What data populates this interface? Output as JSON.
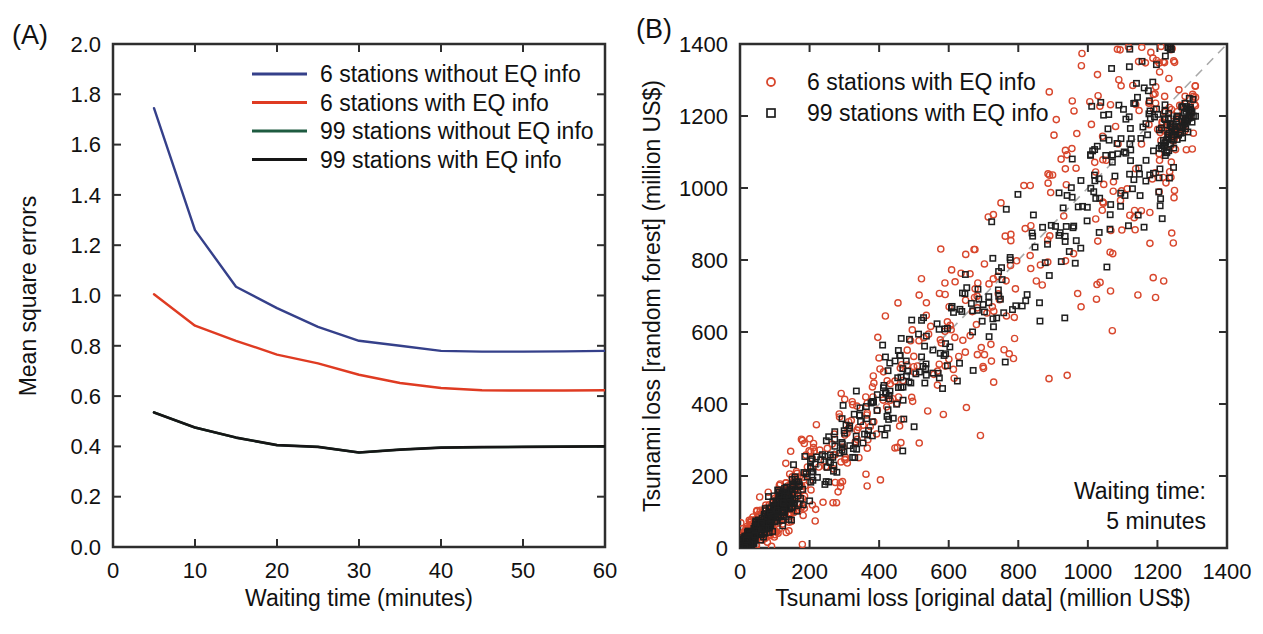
{
  "figure": {
    "background": "#ffffff",
    "panels": [
      {
        "tag": "(A)"
      },
      {
        "tag": "(B)"
      }
    ]
  },
  "style": {
    "frame_color": "#2e2e2e",
    "text_color": "#111111",
    "diagonal_color": "#a9a9a9"
  },
  "chart_data": [
    {
      "type": "line",
      "title": "",
      "xlabel": "Waiting time (minutes)",
      "ylabel": "Mean square errors",
      "xlim": [
        0,
        60
      ],
      "ylim": [
        0.0,
        2.0
      ],
      "x_ticks": [
        0,
        10,
        20,
        30,
        40,
        50,
        60
      ],
      "y_ticks": [
        0.0,
        0.2,
        0.4,
        0.6,
        0.8,
        1.0,
        1.2,
        1.4,
        1.6,
        1.8,
        2.0
      ],
      "y_tick_decimals": 1,
      "grid": false,
      "legend_position": "top-center-inside",
      "x": [
        5,
        10,
        15,
        20,
        25,
        30,
        35,
        40,
        45,
        50,
        55,
        60
      ],
      "series": [
        {
          "name": "6 stations without EQ info",
          "color": "#35408a",
          "values": [
            1.745,
            1.26,
            1.035,
            0.95,
            0.875,
            0.82,
            0.8,
            0.78,
            0.777,
            0.777,
            0.778,
            0.78
          ]
        },
        {
          "name": "6 stations with EQ info",
          "color": "#df3b22",
          "values": [
            1.005,
            0.88,
            0.82,
            0.765,
            0.73,
            0.685,
            0.652,
            0.632,
            0.623,
            0.622,
            0.622,
            0.623
          ]
        },
        {
          "name": "99 stations without EQ info",
          "color": "#1e5b40",
          "values": [
            0.535,
            0.475,
            0.435,
            0.405,
            0.398,
            0.376,
            0.387,
            0.395,
            0.397,
            0.398,
            0.399,
            0.4
          ]
        },
        {
          "name": "99 stations with EQ info",
          "color": "#161616",
          "values": [
            0.535,
            0.475,
            0.435,
            0.405,
            0.398,
            0.376,
            0.387,
            0.395,
            0.397,
            0.398,
            0.399,
            0.4
          ]
        }
      ],
      "note": "99-stations-without-EQ-info curve is hidden beneath the 99-stations-with-EQ-info curve"
    },
    {
      "type": "scatter",
      "title": "",
      "xlabel": "Tsunami loss [original data] (million US$)",
      "ylabel": "Tsunami loss [random forest] (million US$)",
      "xlim": [
        0,
        1400
      ],
      "ylim": [
        0,
        1400
      ],
      "x_ticks": [
        0,
        200,
        400,
        600,
        800,
        1000,
        1200,
        1400
      ],
      "y_ticks": [
        0,
        200,
        400,
        600,
        800,
        1000,
        1200,
        1400
      ],
      "grid": false,
      "legend_position": "top-left-inside",
      "annotation": {
        "lines": [
          "Waiting time:",
          "5 minutes"
        ],
        "align": "right",
        "position": "bottom-right-inside"
      },
      "reference_line": {
        "type": "identity",
        "from": [
          0,
          0
        ],
        "to": [
          1400,
          1400
        ],
        "style": "dashed",
        "color": "#a9a9a9"
      },
      "series": [
        {
          "name": "6 stations with EQ info",
          "marker": "circle",
          "color": "#d8472d",
          "points_spec": {
            "seed": 20110311,
            "n_core": 660,
            "n_cluster": 55,
            "noise_base": 18,
            "noise_scale": 0.2,
            "trend": 0.98,
            "cluster_x": [
              1205,
              1310
            ],
            "cluster_trend": 0.93,
            "cluster_sd": 45
          }
        },
        {
          "name": "99 stations with EQ info",
          "marker": "square",
          "color": "#1f1f1f",
          "points_spec": {
            "seed": 991234,
            "n_core": 660,
            "n_cluster": 75,
            "noise_base": 10,
            "noise_scale": 0.115,
            "trend": 0.985,
            "cluster_x": [
              1205,
              1310
            ],
            "cluster_trend": 0.93,
            "cluster_sd": 28
          }
        }
      ],
      "note": "synthetic point cloud parameters: dense mass near origin fanning out along the 1:1 dashed line, red circles scattered more widely than black squares, tight clump near (1250, 1170)"
    }
  ]
}
